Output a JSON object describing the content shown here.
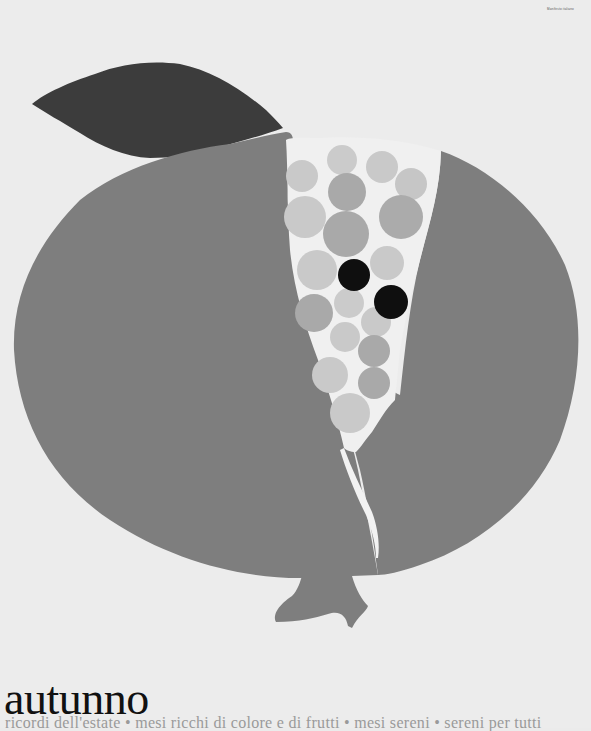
{
  "poster": {
    "title": "autunno",
    "subtitle": "ricordi dell'estate • mesi ricchi di colore e di frutti • mesi sereni • sereni per tutti",
    "credit": "Manifesto italiano",
    "illustration": "pomegranate-with-leaf-and-seeds"
  },
  "colors": {
    "background": "#ececec",
    "fruit": "#7e7e7e",
    "leaf": "#3c3c3c",
    "seeds_light": "#c9c9c9",
    "seeds_mid": "#a9a9a9",
    "seeds_dark": "#0f0f0f",
    "crack": "#f2f2f2"
  }
}
